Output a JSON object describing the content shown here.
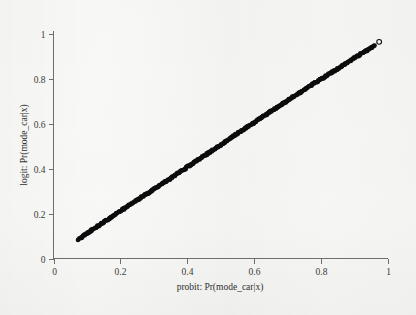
{
  "figure": {
    "background_color": "#f8f8f6",
    "axis_color": "#6e6e6e",
    "marker_color": "#0d0d0d"
  },
  "chart_data": {
    "type": "scatter",
    "title": "",
    "subtitle": "",
    "xlabel": "probit: Pr(mode_car|x)",
    "ylabel": "logit: Pr(mode_car|x)",
    "xlim": [
      0,
      1
    ],
    "ylim": [
      0,
      1
    ],
    "xticks": [
      0,
      0.2,
      0.4,
      0.6,
      0.8,
      1
    ],
    "yticks": [
      0,
      0.2,
      0.4,
      0.6,
      0.8,
      1
    ],
    "xticklabels": [
      "0",
      "0.2",
      "0.4",
      "0.6",
      "0.8",
      "1"
    ],
    "yticklabels": [
      "0",
      "0.2",
      "0.4",
      "0.6",
      "0.8",
      "1"
    ],
    "grid": false,
    "legend": null,
    "legend_position": "none",
    "frame": "left-bottom",
    "marker": "circle",
    "marker_filled": true,
    "n_points": 520,
    "x_data_range": [
      0.075,
      0.962
    ],
    "y_data_range": [
      0.085,
      0.946
    ],
    "relationship": "near-identity, slight S-shaped deviation (logit vs probit predicted probabilities)",
    "series": [
      {
        "name": "probit vs logit predicted probabilities",
        "x": [
          0.075,
          0.09,
          0.105,
          0.12,
          0.135,
          0.15,
          0.165,
          0.18,
          0.195,
          0.21,
          0.225,
          0.24,
          0.255,
          0.27,
          0.285,
          0.3,
          0.315,
          0.33,
          0.345,
          0.36,
          0.375,
          0.39,
          0.405,
          0.42,
          0.435,
          0.45,
          0.465,
          0.48,
          0.495,
          0.51,
          0.525,
          0.54,
          0.555,
          0.57,
          0.585,
          0.6,
          0.615,
          0.63,
          0.645,
          0.66,
          0.675,
          0.69,
          0.705,
          0.72,
          0.735,
          0.75,
          0.765,
          0.78,
          0.795,
          0.81,
          0.825,
          0.84,
          0.855,
          0.87,
          0.885,
          0.9,
          0.915,
          0.93,
          0.945,
          0.962
        ],
        "y": [
          0.085,
          0.1,
          0.116,
          0.131,
          0.146,
          0.161,
          0.176,
          0.191,
          0.206,
          0.221,
          0.235,
          0.25,
          0.264,
          0.279,
          0.293,
          0.308,
          0.322,
          0.337,
          0.351,
          0.366,
          0.381,
          0.396,
          0.411,
          0.425,
          0.44,
          0.455,
          0.47,
          0.485,
          0.5,
          0.515,
          0.53,
          0.545,
          0.56,
          0.575,
          0.59,
          0.604,
          0.619,
          0.634,
          0.648,
          0.663,
          0.677,
          0.692,
          0.706,
          0.721,
          0.735,
          0.749,
          0.764,
          0.778,
          0.792,
          0.806,
          0.82,
          0.834,
          0.848,
          0.862,
          0.876,
          0.89,
          0.904,
          0.918,
          0.932,
          0.946
        ]
      }
    ],
    "outliers": [
      {
        "label": "isolated open marker",
        "x": 0.975,
        "y": 0.963,
        "marker_filled": false
      }
    ],
    "annotations": []
  }
}
